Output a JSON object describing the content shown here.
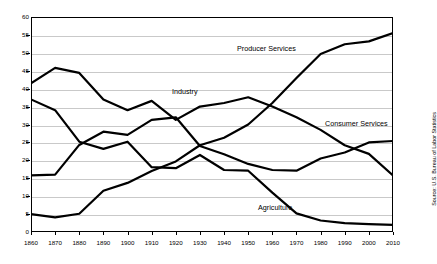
{
  "chart_data": {
    "type": "line",
    "title": "",
    "xlabel": "",
    "ylabel": "",
    "xlim": [
      1860,
      2010
    ],
    "ylim": [
      0,
      60
    ],
    "grid": true,
    "legend_position": "inline-labels",
    "x": [
      1860,
      1870,
      1880,
      1890,
      1900,
      1910,
      1920,
      1930,
      1940,
      1950,
      1960,
      1970,
      1980,
      1990,
      2000,
      2010
    ],
    "categories": [
      "1860",
      "1870",
      "1880",
      "1890",
      "1900",
      "1910",
      "1920",
      "1930",
      "1940",
      "1950",
      "1960",
      "1970",
      "1980",
      "1990",
      "2000",
      "2010"
    ],
    "yticks": [
      0,
      5,
      10,
      15,
      20,
      25,
      30,
      35,
      40,
      45,
      50,
      55,
      60
    ],
    "series": [
      {
        "name": "Producer Services",
        "values": [
          5.0,
          4.1,
          5.1,
          11.5,
          13.7,
          17.0,
          19.7,
          24.2,
          26.3,
          30.0,
          36.0,
          43.0,
          49.7,
          52.4,
          53.2,
          55.5
        ]
      },
      {
        "name": "Industry",
        "values": [
          41.5,
          45.8,
          44.4,
          37.0,
          34.0,
          36.6,
          31.3,
          35.0,
          36.0,
          37.6,
          35.0,
          32.0,
          28.5,
          24.2,
          21.8,
          15.8
        ]
      },
      {
        "name": "Agriculture",
        "values": [
          37.0,
          34.0,
          25.2,
          23.2,
          25.2,
          18.1,
          17.8,
          21.5,
          17.3,
          17.1,
          11.0,
          5.2,
          3.2,
          2.5,
          2.2,
          2.0
        ]
      },
      {
        "name": "Consumer Services",
        "values": [
          15.8,
          16.0,
          24.3,
          28.0,
          27.1,
          31.3,
          32.0,
          24.0,
          21.7,
          19.0,
          17.3,
          17.1,
          20.5,
          22.2,
          25.0,
          25.4
        ]
      }
    ],
    "source": "Source: U.S. Bureau of Labor Statistics"
  },
  "labels": {
    "producer_services": "Producer Services",
    "industry": "Industry",
    "consumer_services": "Consumer Services",
    "agriculture": "Agriculture"
  },
  "colors": {
    "line": "#000000",
    "grid": "#c9c9c9",
    "frame": "#000000",
    "background": "#ffffff"
  }
}
